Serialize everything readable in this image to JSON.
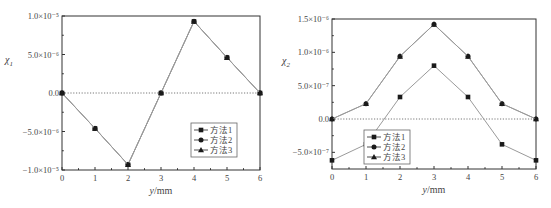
{
  "chart_data": [
    {
      "type": "line",
      "title": "",
      "xlabel": "y/mm",
      "ylabel": "χ1",
      "x": [
        0,
        1,
        2,
        3,
        4,
        5,
        6
      ],
      "xlim": [
        0,
        6
      ],
      "ylim": [
        -1e-05,
        1e-05
      ],
      "xticks": [
        "0",
        "1",
        "2",
        "3",
        "4",
        "5",
        "6"
      ],
      "yticks": [
        {
          "value": 1e-05,
          "label": "1.0×10⁻⁵"
        },
        {
          "value": 5e-06,
          "label": "5.0×10⁻⁶"
        },
        {
          "value": 0,
          "label": "0.0"
        },
        {
          "value": -5e-06,
          "label": "−5.0×10⁻⁶"
        },
        {
          "value": -1e-05,
          "label": "−1.0×10⁻⁵"
        }
      ],
      "zero_line": true,
      "grid": false,
      "legend_position": "lower right",
      "series": [
        {
          "name": "方法1",
          "marker": "square",
          "values": [
            0,
            -4.6e-06,
            -9.3e-06,
            0,
            9.3e-06,
            4.6e-06,
            0
          ]
        },
        {
          "name": "方法2",
          "marker": "circle",
          "values": [
            0,
            -4.6e-06,
            -9.3e-06,
            0,
            9.3e-06,
            4.6e-06,
            0
          ]
        },
        {
          "name": "方法3",
          "marker": "triangle",
          "values": [
            0,
            -4.6e-06,
            -9.3e-06,
            0,
            9.3e-06,
            4.6e-06,
            0
          ]
        }
      ]
    },
    {
      "type": "line",
      "title": "",
      "xlabel": "y/mm",
      "ylabel": "χ2",
      "x": [
        0,
        1,
        2,
        3,
        4,
        5,
        6
      ],
      "xlim": [
        0,
        6
      ],
      "ylim": [
        -7.5e-07,
        1.5e-06
      ],
      "xticks": [
        "0",
        "1",
        "2",
        "3",
        "4",
        "5",
        "6"
      ],
      "yticks": [
        {
          "value": 1.5e-06,
          "label": "1.5×10⁻⁶"
        },
        {
          "value": 1e-06,
          "label": "1.0×10⁻⁶"
        },
        {
          "value": 5e-07,
          "label": "5.0×10⁻⁷"
        },
        {
          "value": 0,
          "label": "0.0"
        },
        {
          "value": -5e-07,
          "label": "−5.0×10⁻⁷"
        }
      ],
      "zero_line": true,
      "grid": false,
      "legend_position": "lower center",
      "series": [
        {
          "name": "方法1",
          "marker": "square",
          "values": [
            -6.2e-07,
            -3.8e-07,
            3.3e-07,
            8e-07,
            3.3e-07,
            -3.8e-07,
            -6.2e-07
          ]
        },
        {
          "name": "方法2",
          "marker": "circle",
          "values": [
            0,
            2.3e-07,
            9.4e-07,
            1.42e-06,
            9.4e-07,
            2.3e-07,
            0
          ]
        },
        {
          "name": "方法3",
          "marker": "triangle",
          "values": [
            0,
            2.3e-07,
            9.4e-07,
            1.42e-06,
            9.4e-07,
            2.3e-07,
            0
          ]
        }
      ]
    }
  ],
  "layout": {
    "left": {
      "plot": {
        "x0": 62,
        "x1": 260,
        "y0": 16,
        "y1": 170
      },
      "legend": {
        "x": 191,
        "y": 123
      }
    },
    "right": {
      "plot": {
        "x0": 56,
        "x1": 260,
        "y0": 19,
        "y1": 169
      },
      "legend": {
        "x": 88,
        "y": 130
      }
    }
  }
}
